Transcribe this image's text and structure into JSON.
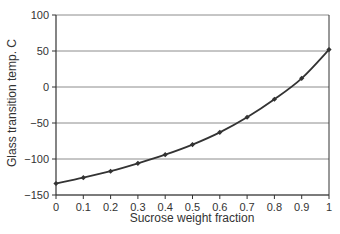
{
  "chart_data": {
    "type": "line",
    "title": "",
    "xlabel": "Sucrose weight fraction",
    "ylabel": "Glass transition temp. C",
    "xlim": [
      0,
      1
    ],
    "ylim": [
      -150,
      100
    ],
    "grid": {
      "horizontal": true,
      "vertical": false
    },
    "legend": null,
    "x_ticks": [
      "0",
      "0.1",
      "0.2",
      "0.3",
      "0.4",
      "0.5",
      "0.6",
      "0.7",
      "0.8",
      "0.9",
      "1"
    ],
    "y_ticks": [
      "100",
      "50",
      "0",
      "-50",
      "-100",
      "-150"
    ],
    "series": [
      {
        "name": "Tg",
        "marker": "diamond",
        "color": "#333333",
        "x": [
          0,
          0.1,
          0.2,
          0.3,
          0.4,
          0.5,
          0.6,
          0.7,
          0.8,
          0.9,
          1.0
        ],
        "y": [
          -134,
          -126,
          -117,
          -106,
          -94,
          -80,
          -63,
          -42,
          -17,
          12,
          52
        ]
      }
    ]
  }
}
